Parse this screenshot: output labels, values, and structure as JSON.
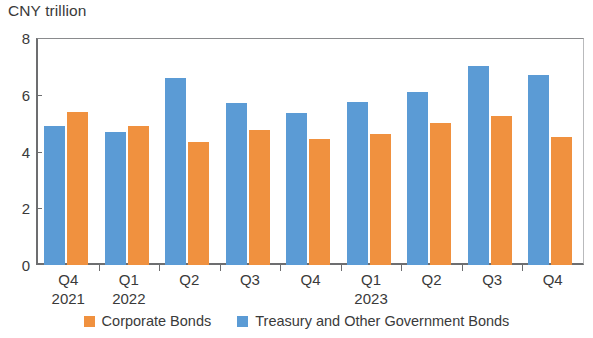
{
  "chart_data": {
    "type": "bar",
    "title": "CNY trillion",
    "subtitle": "",
    "xlabel": "",
    "ylabel": "CNY trillion",
    "ylim": [
      0,
      8
    ],
    "yticks": [
      0,
      2,
      4,
      6,
      8
    ],
    "ytick_labels": [
      "0",
      "2",
      "4",
      "6",
      "8"
    ],
    "grid": false,
    "legend_position": "bottom-center",
    "categories": [
      "Q4",
      "Q1",
      "Q2",
      "Q3",
      "Q4",
      "Q1",
      "Q2",
      "Q3",
      "Q4"
    ],
    "category_years": [
      "2021",
      "2022",
      "",
      "",
      "",
      "2023",
      "",
      "",
      ""
    ],
    "series": [
      {
        "name": "Treasury and Other Government Bonds",
        "color": "#5b9bd5",
        "values": [
          4.9,
          4.7,
          6.6,
          5.7,
          5.35,
          5.75,
          6.1,
          7.0,
          6.7
        ]
      },
      {
        "name": "Corporate Bonds",
        "color": "#f0913f",
        "values": [
          5.4,
          4.9,
          4.35,
          4.75,
          4.45,
          4.6,
          5.0,
          5.25,
          4.5
        ]
      }
    ]
  },
  "legend": {
    "items": [
      {
        "label": "Corporate Bonds",
        "color": "#f0913f"
      },
      {
        "label": "Treasury and Other Government Bonds",
        "color": "#5b9bd5"
      }
    ]
  },
  "axis": {
    "unit_title": "CNY trillion"
  }
}
